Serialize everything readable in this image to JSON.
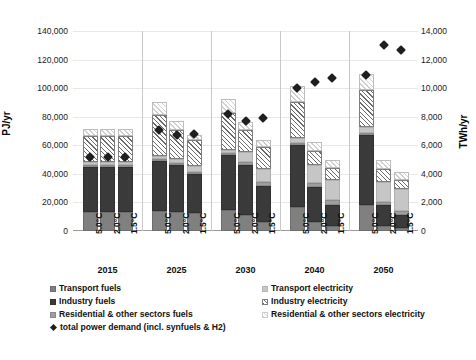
{
  "axes": {
    "left_label": "PJ/yr",
    "right_label": "TWh/yr",
    "left_ticks": [
      "140,000",
      "120,000",
      "100,000",
      "80,000",
      "60,000",
      "40,000",
      "20,000",
      "0"
    ],
    "right_ticks": [
      "14,000",
      "12,000",
      "10,000",
      "8,000",
      "6,000",
      "4,000",
      "2,000",
      "0"
    ]
  },
  "legend": {
    "items": [
      {
        "key": "transport_fuels",
        "label": "Transport fuels",
        "swatch": "transport-fuels-swatch"
      },
      {
        "key": "industry_fuels",
        "label": "Industry fuels",
        "swatch": "industry-fuels-swatch"
      },
      {
        "key": "residential_fuels",
        "label": "Residential & other sectors fuels",
        "swatch": "residential-fuels-swatch"
      },
      {
        "key": "total_power",
        "label": "total power demand (incl. synfuels & H2)",
        "swatch": "total-power-marker"
      },
      {
        "key": "transport_electricity",
        "label": "Transport electricity",
        "swatch": "transport-electricity-swatch"
      },
      {
        "key": "industry_electricity",
        "label": "Industry electricity",
        "swatch": "industry-electricity-swatch"
      },
      {
        "key": "residential_electricity",
        "label": "Residential & other sectors electricity",
        "swatch": "residential-electricity-swatch"
      }
    ]
  },
  "chart_data": {
    "type": "bar",
    "title": "",
    "xlabel": "",
    "ylabel": "PJ/yr",
    "y2label": "TWh/yr",
    "ylim": [
      0,
      140000
    ],
    "y2lim": [
      0,
      14000
    ],
    "ytick_step": 20000,
    "y2tick_step": 2000,
    "grid": true,
    "stacked": true,
    "legend_position": "bottom",
    "groups": [
      "2015",
      "2025",
      "2030",
      "2040",
      "2050"
    ],
    "subcategories": [
      "5.0°C",
      "2.0°C",
      "1.5°C"
    ],
    "categories": [
      "2015 5.0°C",
      "2015 2.0°C",
      "2015 1.5°C",
      "2025 5.0°C",
      "2025 2.0°C",
      "2025 1.5°C",
      "2030 5.0°C",
      "2030 2.0°C",
      "2030 1.5°C",
      "2040 5.0°C",
      "2040 2.0°C",
      "2040 1.5°C",
      "2050 5.0°C",
      "2050 2.0°C",
      "2050 1.5°C"
    ],
    "series": [
      {
        "name": "Transport fuels",
        "values": [
          13000,
          13000,
          13000,
          14000,
          13500,
          12500,
          15000,
          11500,
          6500,
          16500,
          6500,
          3500,
          18000,
          3500,
          2000
        ]
      },
      {
        "name": "Industry fuels",
        "values": [
          32000,
          32000,
          32000,
          35000,
          32500,
          27500,
          38000,
          34500,
          25000,
          43500,
          24000,
          14500,
          49000,
          14500,
          9500
        ]
      },
      {
        "name": "Residential & other sectors fuels",
        "values": [
          1500,
          1500,
          1500,
          1500,
          1500,
          1500,
          1500,
          2500,
          2500,
          1500,
          3000,
          3500,
          1500,
          2500,
          2500
        ]
      },
      {
        "name": "Transport electricity",
        "values": [
          1500,
          1500,
          1500,
          2000,
          3000,
          4000,
          2500,
          6500,
          9500,
          3500,
          12500,
          14500,
          4500,
          14000,
          15500
        ]
      },
      {
        "name": "Industry electricity",
        "values": [
          18500,
          18500,
          18500,
          29000,
          20500,
          18000,
          25500,
          15500,
          15000,
          25500,
          10000,
          8000,
          25500,
          9000,
          6500
        ]
      },
      {
        "name": "Residential & other sectors electricity",
        "values": [
          5000,
          5000,
          5000,
          9000,
          6000,
          4000,
          10000,
          5500,
          5000,
          11000,
          6000,
          5500,
          11500,
          6000,
          5000
        ]
      }
    ],
    "totals_PJ": [
      71500,
      71500,
      71500,
      90500,
      77000,
      67500,
      92500,
      76000,
      63500,
      101500,
      62000,
      49500,
      110000,
      49500,
      41000
    ],
    "marker_series": {
      "name": "total power demand (incl. synfuels & H2)",
      "unit": "TWh/yr",
      "values": [
        5200,
        5200,
        5200,
        7100,
        6700,
        6800,
        8200,
        7700,
        7900,
        10000,
        10400,
        10700,
        10900,
        13000,
        12700
      ]
    }
  },
  "caption": ""
}
